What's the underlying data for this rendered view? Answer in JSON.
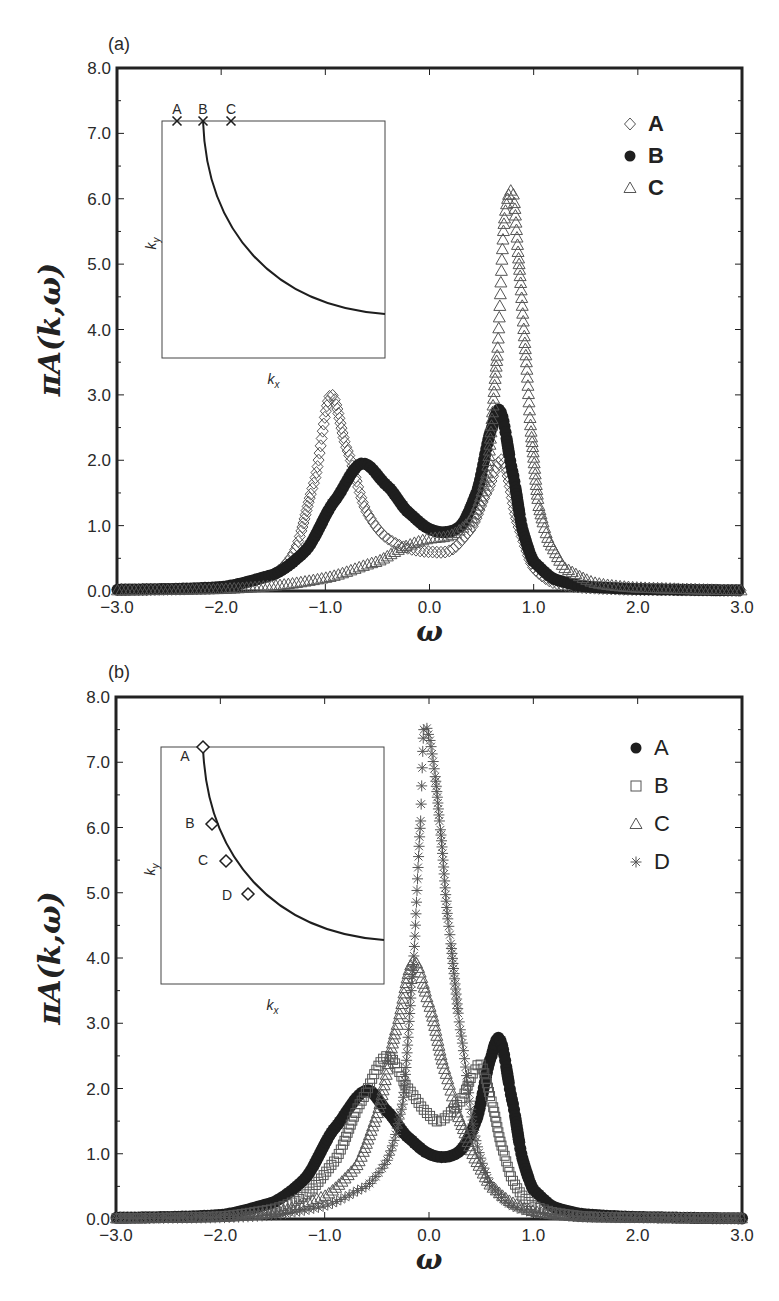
{
  "chart_data": [
    {
      "panel": "(a)",
      "type": "scatter",
      "title": "",
      "xlabel": "ω",
      "ylabel": "πA(k,ω)",
      "xlim": [
        -3.0,
        3.0
      ],
      "ylim": [
        0.0,
        8.0
      ],
      "xticks": [
        "-3.0",
        "-2.0",
        "-1.0",
        "0.0",
        "1.0",
        "2.0",
        "3.0"
      ],
      "yticks": [
        "0.0",
        "1.0",
        "2.0",
        "3.0",
        "4.0",
        "5.0",
        "6.0",
        "7.0",
        "8.0"
      ],
      "grid": false,
      "legend_position": "upper right",
      "legend": [
        {
          "label": "A",
          "marker": "diamond-open"
        },
        {
          "label": "B",
          "marker": "circle-filled"
        },
        {
          "label": "C",
          "marker": "triangle-open"
        }
      ],
      "series": [
        {
          "name": "A",
          "marker": "diamond-open",
          "features": {
            "peak1": {
              "x": -0.95,
              "y": 3.0
            },
            "dip": {
              "x": 0.0,
              "y": 0.6
            },
            "peak2": {
              "x": 0.7,
              "y": 2.0
            }
          },
          "x": [
            -3.0,
            -2.0,
            -1.5,
            -1.3,
            -1.1,
            -0.95,
            -0.8,
            -0.6,
            -0.4,
            -0.2,
            0.0,
            0.2,
            0.4,
            0.55,
            0.7,
            0.85,
            1.0,
            1.2,
            1.5,
            2.0,
            3.0
          ],
          "values": [
            0.02,
            0.05,
            0.25,
            0.6,
            1.7,
            3.0,
            2.2,
            1.2,
            0.8,
            0.65,
            0.6,
            0.62,
            0.95,
            1.5,
            2.0,
            1.0,
            0.35,
            0.12,
            0.05,
            0.02,
            0.01
          ]
        },
        {
          "name": "B",
          "marker": "circle-filled",
          "features": {
            "peak1": {
              "x": -0.65,
              "y": 1.95
            },
            "dip": {
              "x": 0.15,
              "y": 0.9
            },
            "peak2": {
              "x": 0.68,
              "y": 2.75
            }
          },
          "x": [
            -3.0,
            -2.0,
            -1.5,
            -1.2,
            -0.9,
            -0.65,
            -0.4,
            -0.2,
            0.0,
            0.15,
            0.3,
            0.45,
            0.6,
            0.68,
            0.8,
            0.9,
            1.0,
            1.2,
            1.5,
            2.0,
            3.0
          ],
          "values": [
            0.02,
            0.06,
            0.25,
            0.6,
            1.4,
            1.95,
            1.6,
            1.2,
            0.95,
            0.9,
            1.0,
            1.5,
            2.5,
            2.75,
            1.8,
            0.9,
            0.45,
            0.18,
            0.07,
            0.03,
            0.01
          ]
        },
        {
          "name": "C",
          "marker": "triangle-open",
          "features": {
            "shoulder": {
              "x": 0.0,
              "y": 0.8
            },
            "peak": {
              "x": 0.8,
              "y": 6.1
            }
          },
          "x": [
            -3.0,
            -2.0,
            -1.5,
            -1.0,
            -0.5,
            -0.2,
            0.0,
            0.2,
            0.4,
            0.55,
            0.65,
            0.72,
            0.8,
            0.86,
            0.92,
            0.98,
            1.05,
            1.15,
            1.3,
            1.6,
            2.0,
            3.0
          ],
          "values": [
            0.01,
            0.03,
            0.08,
            0.2,
            0.45,
            0.7,
            0.8,
            0.85,
            1.1,
            1.8,
            3.6,
            5.7,
            6.1,
            5.0,
            3.7,
            2.35,
            1.3,
            0.75,
            0.35,
            0.12,
            0.05,
            0.01
          ]
        }
      ],
      "inset": {
        "xlabel": "k_x",
        "ylabel": "k_y",
        "curve": "Fermi-surface arc from top (near B) curving down to the right edge",
        "points": [
          {
            "label": "A",
            "marker": "x",
            "position": "top edge, left of curve"
          },
          {
            "label": "B",
            "marker": "x",
            "position": "top edge, on curve"
          },
          {
            "label": "C",
            "marker": "x",
            "position": "top edge, right of curve"
          }
        ]
      }
    },
    {
      "panel": "(b)",
      "type": "scatter",
      "title": "",
      "xlabel": "ω",
      "ylabel": "πA(k,ω)",
      "xlim": [
        -3.0,
        3.0
      ],
      "ylim": [
        0.0,
        8.0
      ],
      "xticks": [
        "-3.0",
        "-2.0",
        "-1.0",
        "0.0",
        "1.0",
        "2.0",
        "3.0"
      ],
      "yticks": [
        "0.0",
        "1.0",
        "2.0",
        "3.0",
        "4.0",
        "5.0",
        "6.0",
        "7.0",
        "8.0"
      ],
      "grid": false,
      "legend_position": "upper right",
      "legend": [
        {
          "label": "A",
          "marker": "circle-filled"
        },
        {
          "label": "B",
          "marker": "square-open"
        },
        {
          "label": "C",
          "marker": "triangle-open"
        },
        {
          "label": "D",
          "marker": "asterisk"
        }
      ],
      "series": [
        {
          "name": "A",
          "marker": "circle-filled",
          "features": {
            "peak1": {
              "x": -0.6,
              "y": 1.97
            },
            "dip": {
              "x": 0.15,
              "y": 0.95
            },
            "peak2": {
              "x": 0.68,
              "y": 2.75
            }
          },
          "x": [
            -3.0,
            -2.0,
            -1.5,
            -1.2,
            -0.9,
            -0.6,
            -0.4,
            -0.2,
            0.0,
            0.15,
            0.3,
            0.45,
            0.6,
            0.68,
            0.8,
            0.9,
            1.0,
            1.2,
            1.5,
            2.0,
            3.0
          ],
          "values": [
            0.02,
            0.06,
            0.25,
            0.6,
            1.4,
            1.97,
            1.65,
            1.25,
            1.0,
            0.95,
            1.05,
            1.5,
            2.5,
            2.75,
            1.8,
            0.9,
            0.45,
            0.18,
            0.07,
            0.03,
            0.01
          ]
        },
        {
          "name": "B",
          "marker": "square-open",
          "features": {
            "peak1": {
              "x": -0.4,
              "y": 2.5
            },
            "dip": {
              "x": 0.1,
              "y": 1.5
            },
            "peak2": {
              "x": 0.5,
              "y": 2.35
            }
          },
          "x": [
            -3.0,
            -2.0,
            -1.5,
            -1.2,
            -0.9,
            -0.65,
            -0.4,
            -0.2,
            0.0,
            0.1,
            0.3,
            0.45,
            0.5,
            0.6,
            0.7,
            0.8,
            0.9,
            1.0,
            1.2,
            1.5,
            2.0,
            3.0
          ],
          "values": [
            0.01,
            0.04,
            0.15,
            0.35,
            0.9,
            1.8,
            2.5,
            2.0,
            1.6,
            1.5,
            1.8,
            2.3,
            2.35,
            1.8,
            1.1,
            0.6,
            0.35,
            0.2,
            0.1,
            0.04,
            0.02,
            0.01
          ]
        },
        {
          "name": "C",
          "marker": "triangle-open",
          "features": {
            "peak": {
              "x": -0.15,
              "y": 3.95
            }
          },
          "x": [
            -3.0,
            -2.0,
            -1.5,
            -1.0,
            -0.7,
            -0.5,
            -0.3,
            -0.15,
            0.0,
            0.15,
            0.3,
            0.45,
            0.6,
            0.8,
            1.0,
            1.2,
            1.5,
            2.0,
            3.0
          ],
          "values": [
            0.01,
            0.03,
            0.1,
            0.35,
            0.8,
            1.6,
            3.0,
            3.95,
            3.3,
            2.3,
            1.5,
            0.9,
            0.5,
            0.25,
            0.12,
            0.07,
            0.03,
            0.02,
            0.01
          ]
        },
        {
          "name": "D",
          "marker": "asterisk",
          "features": {
            "peak": {
              "x": -0.05,
              "y": 7.5
            }
          },
          "x": [
            -3.0,
            -2.0,
            -1.5,
            -1.0,
            -0.6,
            -0.4,
            -0.25,
            -0.15,
            -0.08,
            -0.05,
            0.0,
            0.05,
            0.1,
            0.18,
            0.3,
            0.45,
            0.6,
            0.8,
            1.0,
            1.5,
            2.0,
            3.0
          ],
          "values": [
            0.01,
            0.02,
            0.06,
            0.2,
            0.5,
            0.9,
            1.8,
            3.9,
            6.1,
            7.5,
            7.4,
            6.9,
            6.1,
            4.6,
            2.9,
            1.2,
            0.5,
            0.2,
            0.1,
            0.03,
            0.02,
            0.01
          ]
        }
      ],
      "inset": {
        "xlabel": "k_x",
        "ylabel": "k_y",
        "curve": "Fermi-surface arc from top-left curving down to the right edge",
        "points": [
          {
            "label": "A",
            "marker": "diamond-open",
            "position": "top of arc"
          },
          {
            "label": "B",
            "marker": "diamond-open",
            "position": "upper arc"
          },
          {
            "label": "C",
            "marker": "diamond-open",
            "position": "middle arc"
          },
          {
            "label": "D",
            "marker": "diamond-open",
            "position": "lower arc"
          }
        ]
      }
    }
  ],
  "panels": {
    "a": {
      "label": "(a)",
      "legend_labels": [
        "A",
        "B",
        "C"
      ],
      "inset_point_labels": [
        "A",
        "B",
        "C"
      ]
    },
    "b": {
      "label": "(b)",
      "legend_labels": [
        "A",
        "B",
        "C",
        "D"
      ],
      "inset_point_labels": [
        "A",
        "B",
        "C",
        "D"
      ]
    }
  },
  "axes": {
    "xlabel": "ω",
    "ylabel_pi": "π",
    "ylabel_rest": "A(k,ω)",
    "inset_xlabel": "k",
    "inset_xlabel_sub": "x",
    "inset_ylabel": "k",
    "inset_ylabel_sub": "y",
    "xticks": [
      "−3.0",
      "−2.0",
      "−1.0",
      "0.0",
      "1.0",
      "2.0",
      "3.0"
    ],
    "yticks": [
      "0.0",
      "1.0",
      "2.0",
      "3.0",
      "4.0",
      "5.0",
      "6.0",
      "7.0",
      "8.0"
    ]
  },
  "colors": {
    "ink": "#1e1e1e",
    "marker_gray": "#555555",
    "frame": "#222222",
    "background": "#ffffff"
  }
}
